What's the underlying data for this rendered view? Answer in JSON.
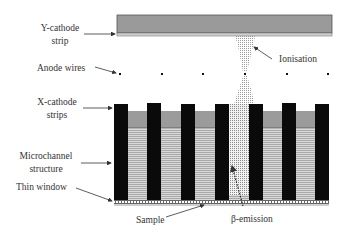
{
  "diagram": {
    "labels": {
      "y_cathode_line1": "Y-cathode",
      "y_cathode_line2": "strip",
      "anode_wires": "Anode wires",
      "ionisation": "Ionisation",
      "x_cathode_line1": "X-cathode",
      "x_cathode_line2": "strips",
      "microchannel_line1": "Microchannel",
      "microchannel_line2": "structure",
      "thin_window": "Thin window",
      "sample": "Sample",
      "beta_emission": "β-emission"
    },
    "components": [
      {
        "name": "Y-cathode strip",
        "type": "plate",
        "position": "top"
      },
      {
        "name": "Anode wires",
        "type": "wire-row",
        "count": 6
      },
      {
        "name": "X-cathode strips",
        "type": "pillar-caps",
        "count": 7
      },
      {
        "name": "Microchannel structure",
        "type": "channels",
        "count": 6
      },
      {
        "name": "Thin window",
        "type": "layer"
      },
      {
        "name": "Sample",
        "type": "layer",
        "position": "bottom"
      }
    ],
    "colors": {
      "plate_gray": "#9a9a9a",
      "plate_edge": "#555555",
      "plate_light": "#cfcfcf",
      "pillar_black": "#0a0a0a",
      "band_gray": "#9b9b9b",
      "stripe_light": "#d8d8d8",
      "stripe_dark": "#a8a8a8",
      "dot_cloud": "#8a8a8a",
      "text": "#333333"
    }
  }
}
